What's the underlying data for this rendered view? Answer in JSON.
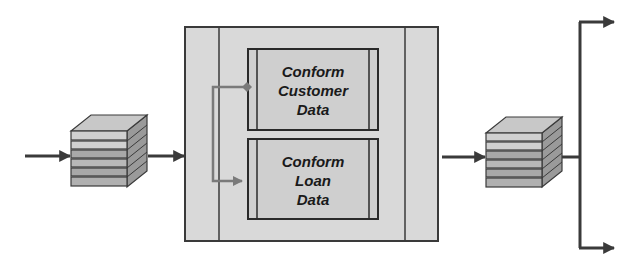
{
  "diagram": {
    "type": "data-flow",
    "input_arrow": {
      "from": "external",
      "to": "source-stack"
    },
    "source_stack": {
      "layers": 5,
      "shape": "stacked-files"
    },
    "process_container": {
      "processes": [
        {
          "id": "customer",
          "lines": [
            "Conform",
            "Customer",
            "Data"
          ]
        },
        {
          "id": "loan",
          "lines": [
            "Conform",
            "Loan",
            "Data"
          ]
        }
      ]
    },
    "target_stack": {
      "layers": 5,
      "shape": "stacked-files"
    },
    "output_branches": [
      {
        "id": "top",
        "direction": "right"
      },
      {
        "id": "bottom",
        "direction": "right"
      }
    ]
  },
  "colors": {
    "line": "#3a3a3a",
    "container_fill": "#d9d9d9",
    "process_fill": "#cfcfcf",
    "connector": "#7a7a7a",
    "stack_top": "#c8c8c8",
    "stack_side": "#9a9a9a",
    "stack_light": "#d0d0d0",
    "stack_dark": "#a8a8a8"
  }
}
